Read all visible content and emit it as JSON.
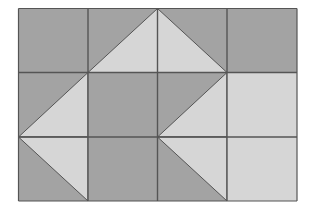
{
  "diagram": {
    "grid": {
      "rows": 3,
      "cols": 4
    },
    "colors": {
      "dark": "#a3a3a3",
      "light": "#d6d6d6",
      "line": "#555555",
      "background": "#ffffff"
    },
    "cells": [
      {
        "row": 0,
        "col": 0,
        "fill": "dark"
      },
      {
        "row": 0,
        "col": 1,
        "fill": "dark",
        "triangle": {
          "corner": "bottom-right",
          "fill": "light"
        }
      },
      {
        "row": 0,
        "col": 2,
        "fill": "dark",
        "triangle": {
          "corner": "bottom-left",
          "fill": "light"
        }
      },
      {
        "row": 0,
        "col": 3,
        "fill": "dark"
      },
      {
        "row": 1,
        "col": 0,
        "fill": "dark",
        "triangle": {
          "corner": "bottom-right",
          "fill": "light"
        }
      },
      {
        "row": 1,
        "col": 1,
        "fill": "dark"
      },
      {
        "row": 1,
        "col": 2,
        "fill": "dark",
        "triangle": {
          "corner": "bottom-right",
          "fill": "light"
        }
      },
      {
        "row": 1,
        "col": 3,
        "fill": "light"
      },
      {
        "row": 2,
        "col": 0,
        "fill": "dark",
        "triangle": {
          "corner": "top-right",
          "fill": "light"
        }
      },
      {
        "row": 2,
        "col": 1,
        "fill": "dark"
      },
      {
        "row": 2,
        "col": 2,
        "fill": "dark",
        "triangle": {
          "corner": "top-right",
          "fill": "light"
        }
      },
      {
        "row": 2,
        "col": 3,
        "fill": "light"
      }
    ]
  }
}
